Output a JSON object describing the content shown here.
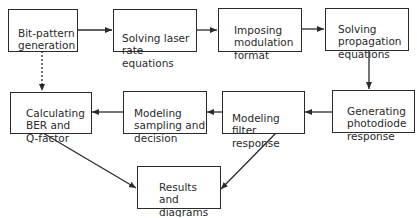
{
  "diagram": {
    "type": "flowchart",
    "nodes": [
      {
        "id": "bit_pattern",
        "label": "Bit-pattern\ngeneration"
      },
      {
        "id": "laser",
        "label": "Solving laser\nrate equations"
      },
      {
        "id": "modulation",
        "label": "Imposing\nmodulation\nformat"
      },
      {
        "id": "propagation",
        "label": "Solving\npropagation\nequations"
      },
      {
        "id": "photodiode",
        "label": "Generating\nphotodiode\nresponse"
      },
      {
        "id": "filter",
        "label": "Modeling\nfilter response"
      },
      {
        "id": "sampling",
        "label": "Modeling\nsampling and\ndecision"
      },
      {
        "id": "ber",
        "label": "Calculating\nBER and\nQ-factor"
      },
      {
        "id": "results",
        "label": "Results\nand\ndiagrams"
      }
    ],
    "edges": [
      {
        "from": "bit_pattern",
        "to": "laser",
        "style": "solid"
      },
      {
        "from": "laser",
        "to": "modulation",
        "style": "solid"
      },
      {
        "from": "modulation",
        "to": "propagation",
        "style": "solid"
      },
      {
        "from": "propagation",
        "to": "photodiode",
        "style": "solid"
      },
      {
        "from": "photodiode",
        "to": "filter",
        "style": "solid"
      },
      {
        "from": "filter",
        "to": "sampling",
        "style": "solid"
      },
      {
        "from": "sampling",
        "to": "ber",
        "style": "solid"
      },
      {
        "from": "bit_pattern",
        "to": "ber",
        "style": "dotted"
      },
      {
        "from": "ber",
        "to": "results",
        "style": "solid"
      },
      {
        "from": "filter",
        "to": "results",
        "style": "solid"
      }
    ],
    "colors": {
      "stroke": "#2a2a2a",
      "background": "#ffffff"
    }
  }
}
